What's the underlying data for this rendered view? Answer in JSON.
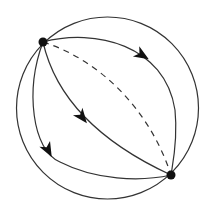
{
  "diagram": {
    "type": "sphere-geodesics",
    "stroke_color": "#333333",
    "node_color": "#111111",
    "background": "#ffffff",
    "outer_circle": {
      "cx": 107.5,
      "cy": 108,
      "r": 91
    },
    "nodes": [
      {
        "id": "top-left",
        "x": 43,
        "y": 42,
        "r": 4.5
      },
      {
        "id": "bottom-right",
        "x": 171,
        "y": 175,
        "r": 4.5
      }
    ],
    "edges": [
      {
        "id": "upper-right-arc",
        "style": "solid",
        "arrow": true,
        "d": "M43,42 C95,28 165,45 175,110 C178,140 173,162 171,175",
        "arrow_at": {
          "x": 142,
          "y": 55,
          "angle": 32
        }
      },
      {
        "id": "dashed-arc",
        "style": "dashed",
        "arrow": false,
        "d": "M43,42 C100,60 150,110 171,175"
      },
      {
        "id": "middle-arc",
        "style": "solid",
        "arrow": true,
        "d": "M43,42 C55,95 95,140 171,175",
        "arrow_at": {
          "x": 82,
          "y": 117,
          "angle": 52
        }
      },
      {
        "id": "left-inner-arc",
        "style": "solid",
        "arrow": true,
        "d": "M43,42 C25,90 32,150 60,162 C95,180 140,182 171,175",
        "arrow_at": {
          "x": 48,
          "y": 150,
          "angle": 62
        }
      }
    ]
  }
}
